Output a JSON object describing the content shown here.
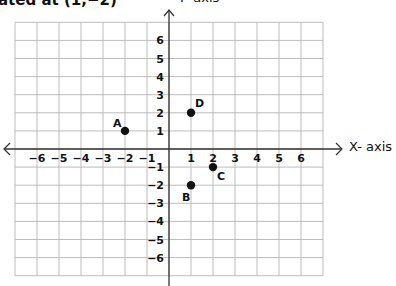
{
  "title": "ated at (1,−2)",
  "y_axis_title": "Y- axis",
  "x_axis_title": "X- axis",
  "colors": {
    "grid": "#bdbdbd",
    "axis": "#333333",
    "point": "#111111"
  },
  "grid": {
    "x_min": -7,
    "x_max": 7,
    "y_min": -7,
    "y_max": 7
  },
  "x_tick_labels": [
    "−6",
    "−5",
    "−4",
    "−3",
    "−2",
    "−1",
    "1",
    "2",
    "3",
    "4",
    "5",
    "6"
  ],
  "y_tick_labels": [
    "6",
    "5",
    "4",
    "3",
    "2",
    "1",
    "−1",
    "−2",
    "−3",
    "−4",
    "−5",
    "−6"
  ],
  "points": [
    {
      "label": "A",
      "x": -2,
      "y": 1
    },
    {
      "label": "B",
      "x": 1,
      "y": -2
    },
    {
      "label": "C",
      "x": 2,
      "y": -1
    },
    {
      "label": "D",
      "x": 1,
      "y": 2
    }
  ]
}
